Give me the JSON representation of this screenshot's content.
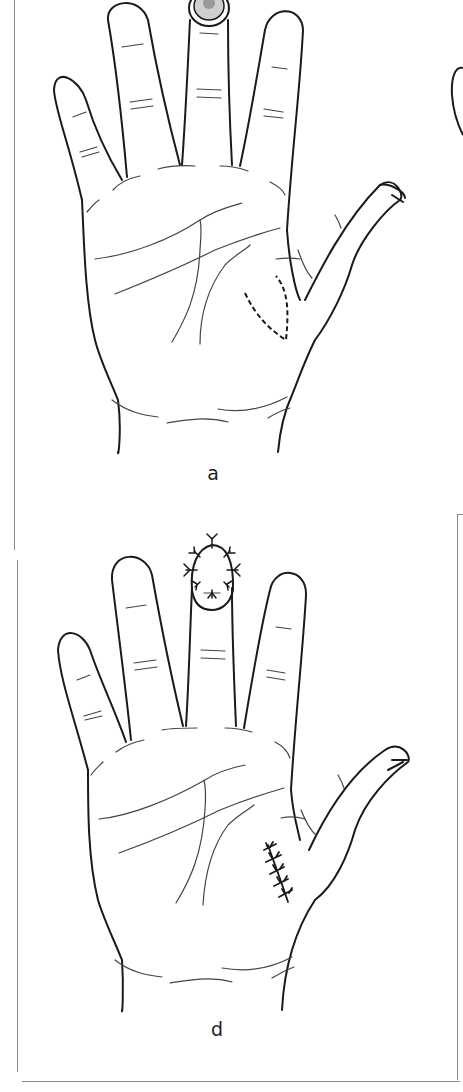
{
  "figure": {
    "type": "medical-illustration",
    "panels": [
      {
        "id": "a",
        "label": "a",
        "annotations": [
          "fingertip defect on middle finger (shaded)",
          "dashed incision outline on thenar eminence (donor site)"
        ]
      },
      {
        "id": "d",
        "label": "d",
        "annotations": [
          "sutured graft on middle fingertip",
          "sutured donor site on thenar eminence"
        ]
      }
    ],
    "partial_panels_visible": [
      "b (cropped, right edge)",
      "e (cropped frame, right edge)"
    ]
  },
  "colors": {
    "line": "#1a1a1a",
    "crease": "#444444",
    "frame": "#8a8a8a",
    "defect_fill": "#cfcfcf",
    "defect_core": "#9a9a9a"
  }
}
